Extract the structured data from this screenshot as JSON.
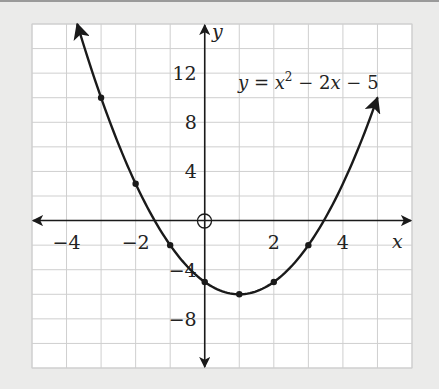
{
  "chart_data": {
    "type": "line",
    "title": "",
    "equation": "y = x^2 - 2x - 5",
    "annotation": {
      "text_main": "y = x",
      "sup": "2",
      "text_rest": " − 2x − 5"
    },
    "xlabel": "x",
    "ylabel": "y",
    "xlim": [
      -5,
      6
    ],
    "ylim": [
      -12,
      16
    ],
    "grid": true,
    "x_grid_step": 1,
    "y_grid_step": 2,
    "x_tick_labels": [
      "−4",
      "−2",
      "2",
      "4"
    ],
    "x_ticks": [
      -4,
      -2,
      2,
      4
    ],
    "y_tick_labels": [
      "12",
      "8",
      "4",
      "−4",
      "−8"
    ],
    "y_ticks": [
      12,
      8,
      4,
      -4,
      -8
    ],
    "marked_points": [
      {
        "x": -3,
        "y": 10
      },
      {
        "x": -2,
        "y": 3
      },
      {
        "x": -1,
        "y": -2
      },
      {
        "x": 0,
        "y": -5
      },
      {
        "x": 1,
        "y": -6
      },
      {
        "x": 2,
        "y": -5
      },
      {
        "x": 3,
        "y": -2
      }
    ],
    "curve_x_range": [
      -3.69,
      5
    ],
    "origin_marker": "open-circle",
    "colors": {
      "curve": "#1a1a1a",
      "grid": "#cfcfcf",
      "axes": "#1a1a1a",
      "background": "#ffffff",
      "page": "#ebebea"
    }
  }
}
